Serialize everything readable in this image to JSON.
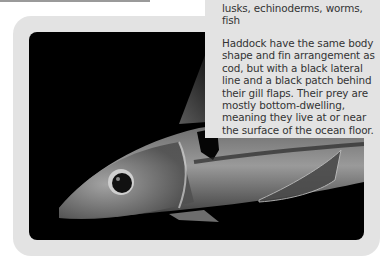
{
  "sidebar_text": {
    "prey_list": "lusks, echinoderms, worms, fish",
    "description": "Haddock have the same body shape and fin arrangement as cod, but with a black lateral line and a black patch behind their gill flaps. Their prey are mostly bottom-dwelling, meaning they live at or near the surface of the ocean floor."
  },
  "photo": {
    "subject": "haddock",
    "background_color": "#000000"
  },
  "colors": {
    "frame": "#e3e3e3",
    "text": "#333333",
    "top_rule": "#9a9a9a"
  }
}
